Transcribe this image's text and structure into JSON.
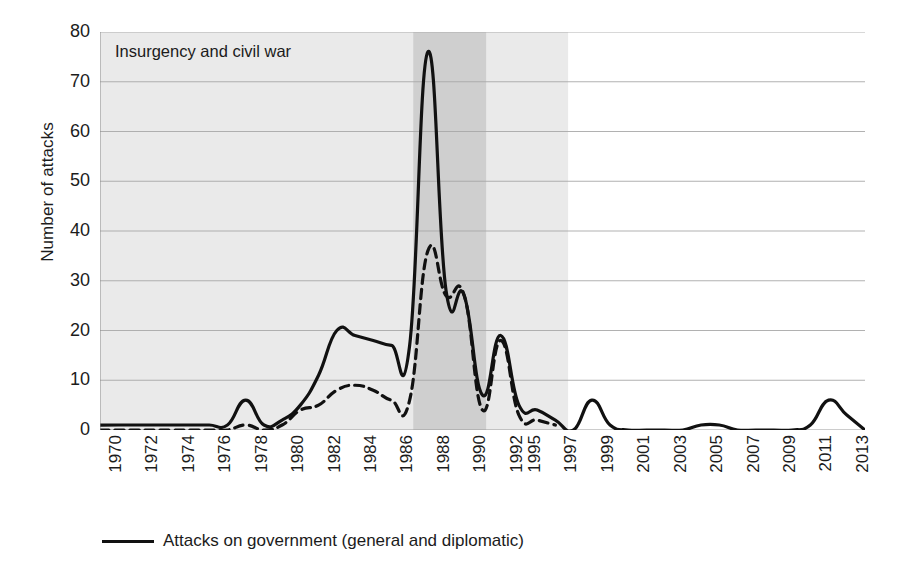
{
  "chart_data": {
    "type": "line",
    "title": "",
    "xlabel": "",
    "ylabel": "Number of attacks",
    "ylim": [
      0,
      80
    ],
    "ytick_labels": [
      "80",
      "70",
      "60",
      "50",
      "40",
      "30",
      "20",
      "10",
      "0"
    ],
    "ytick_values": [
      80,
      70,
      60,
      50,
      40,
      30,
      20,
      10,
      0
    ],
    "grid": "horizontal",
    "legend_position": "bottom-left",
    "x": [
      1970,
      1971,
      1972,
      1973,
      1974,
      1975,
      1976,
      1977,
      1978,
      1979,
      1980,
      1981,
      1982,
      1983,
      1984,
      1985,
      1986,
      1987,
      1988,
      1989,
      1990,
      1991,
      1992,
      1995,
      1996,
      1997,
      1998,
      1999,
      2000,
      2001,
      2002,
      2003,
      2004,
      2005,
      2006,
      2007,
      2008,
      2009,
      2010,
      2011,
      2012,
      2013,
      2014
    ],
    "xtick_labels": [
      "1970",
      "1972",
      "1974",
      "1976",
      "1978",
      "1980",
      "1982",
      "1984",
      "1986",
      "1988",
      "1990",
      "1992",
      "1995",
      "1997",
      "1999",
      "2001",
      "2003",
      "2005",
      "2007",
      "2009",
      "2011",
      "2013"
    ],
    "series": [
      {
        "name": "Attacks on government (general and diplomatic)",
        "style": "solid",
        "color": "#111111",
        "values": [
          1,
          1,
          1,
          1,
          1,
          1,
          1,
          1,
          6,
          1,
          2,
          5,
          11,
          20,
          19,
          18,
          17,
          17,
          76,
          28,
          27,
          7,
          19,
          5,
          4,
          2,
          0,
          6,
          1,
          0,
          0,
          0,
          0,
          1,
          1,
          0,
          0,
          0,
          0,
          1,
          6,
          3,
          0
        ]
      },
      {
        "name": "Attacks on government (unmarked dashed series)",
        "style": "dashed",
        "color": "#111111",
        "values": [
          0,
          0,
          0,
          0,
          0,
          0,
          0,
          0,
          1,
          0,
          1,
          4,
          5,
          8,
          9,
          8,
          6,
          6,
          36,
          27,
          27,
          4,
          18,
          3,
          2,
          1,
          null,
          null,
          null,
          null,
          null,
          null,
          null,
          null,
          null,
          null,
          null,
          null,
          null,
          null,
          null,
          null,
          null
        ]
      }
    ],
    "shaded_bands": [
      {
        "label": "insurgency-and-civil-war-outer",
        "from_index": 0,
        "to_index": 25.7,
        "color": "#eaeaea"
      },
      {
        "label": "insurgency-and-civil-war-inner",
        "from_index": 17.2,
        "to_index": 21.2,
        "color": "#cfcfcf"
      }
    ],
    "annotations": [
      {
        "text": "Insurgency and civil war",
        "x": 1971.0,
        "y": 76
      }
    ]
  },
  "legend": {
    "entries": [
      {
        "label": "Attacks on government (general and diplomatic)",
        "style": "solid"
      }
    ]
  }
}
